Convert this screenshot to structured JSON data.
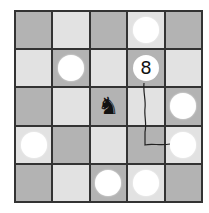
{
  "puzzle": {
    "rows": 5,
    "cols": 5,
    "colors": {
      "dark": "#b3b3b3",
      "light": "#e2e2e2",
      "grid": "#333333",
      "disc": "#ffffff"
    },
    "cells": [
      [
        {
          "shade": "dark"
        },
        {
          "shade": "light"
        },
        {
          "shade": "dark"
        },
        {
          "shade": "light",
          "piece": "disc"
        },
        {
          "shade": "dark"
        }
      ],
      [
        {
          "shade": "light"
        },
        {
          "shade": "dark",
          "piece": "disc"
        },
        {
          "shade": "light"
        },
        {
          "shade": "dark",
          "piece": "number",
          "value": "8"
        },
        {
          "shade": "light"
        }
      ],
      [
        {
          "shade": "dark"
        },
        {
          "shade": "light"
        },
        {
          "shade": "dark",
          "piece": "knight",
          "glyph": "♞"
        },
        {
          "shade": "light"
        },
        {
          "shade": "dark",
          "piece": "disc"
        }
      ],
      [
        {
          "shade": "light",
          "piece": "disc"
        },
        {
          "shade": "dark"
        },
        {
          "shade": "light"
        },
        {
          "shade": "dark"
        },
        {
          "shade": "light",
          "piece": "disc"
        }
      ],
      [
        {
          "shade": "dark"
        },
        {
          "shade": "light"
        },
        {
          "shade": "dark",
          "piece": "disc"
        },
        {
          "shade": "light",
          "piece": "disc"
        },
        {
          "shade": "dark"
        }
      ]
    ],
    "numbered_disc": {
      "label": "8",
      "row": 2,
      "col": 4
    },
    "knight": {
      "glyph": "♞",
      "row": 3,
      "col": 3
    },
    "rope": {
      "from": {
        "row": 2,
        "col": 4
      },
      "to": {
        "row": 4,
        "col": 5
      }
    }
  }
}
